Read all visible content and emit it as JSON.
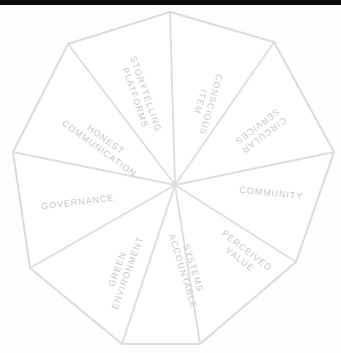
{
  "diagram": {
    "type": "radial-wheel",
    "shape": "decagon",
    "segment_count": 10,
    "title": "",
    "colors": {
      "outline": "#dcdcdc",
      "spoke": "#dedede",
      "label_text": "#c9c9c9",
      "background": "#ffffff",
      "top_band": "#0a0a0a"
    },
    "center": {
      "x": 175,
      "y": 185
    },
    "segments": [
      {
        "id": "conscious-item",
        "lines": [
          "CONSCIOUS",
          "ITEM"
        ],
        "full_label": "CONSCIOUS ITEM",
        "angle_deg": -72,
        "text_rotation_deg": 108
      },
      {
        "id": "circular-services",
        "lines": [
          "CIRCULAR",
          "SERVICES"
        ],
        "full_label": "CIRCULAR SERVICES",
        "angle_deg": -36,
        "text_rotation_deg": 144
      },
      {
        "id": "community",
        "lines": [
          "COMMUNITY"
        ],
        "full_label": "COMMUNITY",
        "angle_deg": 0,
        "text_rotation_deg": 0
      },
      {
        "id": "perceived-value",
        "lines": [
          "PERCEIVED",
          "VALUE"
        ],
        "full_label": "PERCEIVED VALUE",
        "angle_deg": 36,
        "text_rotation_deg": 36
      },
      {
        "id": "accountable-systems",
        "lines": [
          "ACCOUNTABLE",
          "SYSTEMS"
        ],
        "full_label": "ACCOUNTABLE SYSTEMS",
        "angle_deg": 72,
        "text_rotation_deg": 72
      },
      {
        "id": "green-environment",
        "lines": [
          "GREEN",
          "ENVIRONMENT"
        ],
        "full_label": "GREEN ENVIRONMENT",
        "angle_deg": 108,
        "text_rotation_deg": 108
      },
      {
        "id": "governance",
        "lines": [
          "GOVERNANCE"
        ],
        "full_label": "GOVERNANCE",
        "angle_deg": 180,
        "text_rotation_deg": 0
      },
      {
        "id": "honest-communication",
        "lines": [
          "HONEST",
          "COMMUNICATION"
        ],
        "full_label": "HONEST COMMUNICATION",
        "angle_deg": -144,
        "text_rotation_deg": 36
      },
      {
        "id": "storytelling-platforms",
        "lines": [
          "STORYTELLING",
          "PLATFORMS"
        ],
        "full_label": "STORYTELLING PLATFORMS",
        "angle_deg": -108,
        "text_rotation_deg": 72
      }
    ],
    "all_labels": [
      "CONSCIOUS ITEM",
      "CIRCULAR SERVICES",
      "COMMUNITY",
      "PERCEIVED VALUE",
      "ACCOUNTABLE SYSTEMS",
      "GREEN ENVIRONMENT",
      "GOVERNANCE",
      "HONEST COMMUNICATION",
      "STORYTELLING PLATFORMS"
    ]
  }
}
